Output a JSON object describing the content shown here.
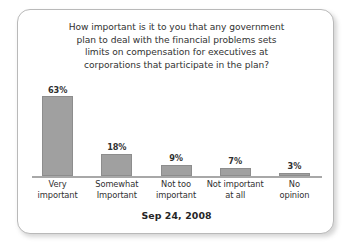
{
  "card": {
    "title_lines": [
      "How important is it to you that any government",
      "plan to deal with the financial problems sets",
      "limits on compensation for executives at",
      "corporations that participate in the plan?"
    ],
    "footer_date": "Sep 24, 2008"
  },
  "chart_data": {
    "type": "bar",
    "title": "How important is it to you that any government plan to deal with the financial problems sets limits on compensation for executives at corporations that participate in the plan?",
    "subtitle": "Sep 24, 2008",
    "xlabel": "",
    "ylabel": "",
    "ylim": [
      0,
      70
    ],
    "grid": false,
    "legend": "none",
    "orientation": "vertical",
    "bar_color": "#a0a0a0",
    "bar_border_color": "#8d8d8d",
    "axis_color": "#a8a8a8",
    "value_label_suffix": "%",
    "categories": [
      "Very important",
      "Somewhat Important",
      "Not too important",
      "Not important at all",
      "No opinion"
    ],
    "category_lines": [
      [
        "Very",
        "important"
      ],
      [
        "Somewhat",
        "Important"
      ],
      [
        "Not too",
        "important"
      ],
      [
        "Not important",
        "at all"
      ],
      [
        "No",
        "opinion"
      ]
    ],
    "values": [
      63,
      18,
      9,
      7,
      3
    ],
    "value_labels": [
      "63%",
      "18%",
      "9%",
      "7%",
      "3%"
    ]
  }
}
